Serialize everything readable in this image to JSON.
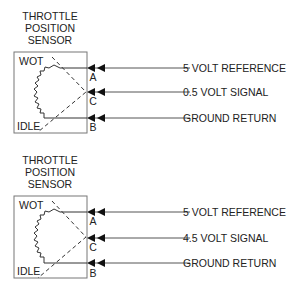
{
  "diagrams": [
    {
      "title_lines": [
        "THROTTLE",
        "POSITION",
        "SENSOR"
      ],
      "wot_label": "WOT",
      "idle_label": "IDLE",
      "pins": {
        "a": "A",
        "c": "C",
        "b": "B"
      },
      "signals": [
        {
          "pin": "A",
          "label": "5 VOLT REFERENCE"
        },
        {
          "pin": "C",
          "label": "0.5 VOLT SIGNAL"
        },
        {
          "pin": "B",
          "label": "GROUND RETURN"
        }
      ],
      "throttle_state": "idle"
    },
    {
      "title_lines": [
        "THROTTLE",
        "POSITION",
        "SENSOR"
      ],
      "wot_label": "WOT",
      "idle_label": "IDLE",
      "pins": {
        "a": "A",
        "c": "C",
        "b": "B"
      },
      "signals": [
        {
          "pin": "A",
          "label": "5 VOLT REFERENCE"
        },
        {
          "pin": "C",
          "label": "4.5 VOLT SIGNAL"
        },
        {
          "pin": "B",
          "label": "GROUND RETURN"
        }
      ],
      "throttle_state": "wot"
    }
  ],
  "colors": {
    "line": "#555555",
    "text": "#222222",
    "box": "#777777"
  }
}
